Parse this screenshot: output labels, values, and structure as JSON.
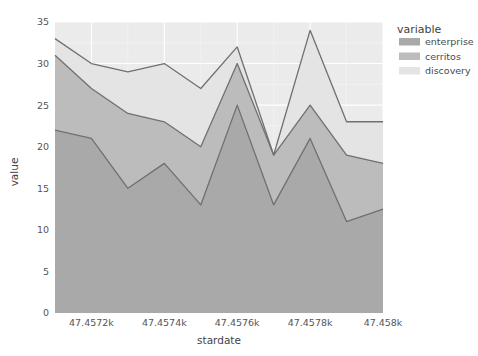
{
  "chart_data": {
    "type": "area",
    "title": "",
    "subtitle": "",
    "xlabel": "stardate",
    "ylabel": "value",
    "legend_title": "variable",
    "legend_position": "right",
    "grid": true,
    "stacked": true,
    "xlim": [
      47457.1,
      47458.0
    ],
    "ylim": [
      0,
      35
    ],
    "x": [
      47457.1,
      47457.2,
      47457.3,
      47457.4,
      47457.5,
      47457.6,
      47457.7,
      47457.8,
      47457.9,
      47458.0
    ],
    "xtick_values": [
      47457.2,
      47457.4,
      47457.6,
      47457.8,
      47458.0
    ],
    "xtick_labels": [
      "47.4572k",
      "47.4574k",
      "47.4576k",
      "47.4578k",
      "47.458k"
    ],
    "ytick_values": [
      0,
      5,
      10,
      15,
      20,
      25,
      30,
      35
    ],
    "ytick_labels": [
      "0",
      "5",
      "10",
      "15",
      "20",
      "25",
      "30",
      "35"
    ],
    "series": [
      {
        "name": "enterprise",
        "color": "#a9a9a9",
        "values": [
          22,
          21,
          15,
          18,
          13,
          25,
          13,
          21,
          11,
          12.5
        ]
      },
      {
        "name": "cerritos",
        "color": "#bcbcbc",
        "values": [
          9,
          6,
          9,
          5,
          7,
          5,
          6,
          4,
          8,
          5.5
        ]
      },
      {
        "name": "discovery",
        "color": "#e4e4e4",
        "values": [
          2,
          3,
          5,
          7,
          7,
          2,
          0,
          9,
          4,
          5
        ]
      }
    ],
    "cumulative": {
      "enterprise_top": [
        22,
        21,
        15,
        18,
        13,
        25,
        13,
        21,
        11,
        12.5
      ],
      "cerritos_top": [
        31,
        27,
        24,
        23,
        20,
        30,
        19,
        25,
        19,
        18
      ],
      "discovery_top": [
        33,
        30,
        29,
        30,
        27,
        32,
        19,
        34,
        23,
        23
      ]
    },
    "panel_background": "#ebebeb",
    "line_color": "#707070"
  },
  "legend": {
    "title": "variable",
    "items": [
      {
        "label": "enterprise",
        "color": "#a9a9a9"
      },
      {
        "label": "cerritos",
        "color": "#bcbcbc"
      },
      {
        "label": "discovery",
        "color": "#e4e4e4"
      }
    ]
  },
  "axes": {
    "x_title": "stardate",
    "y_title": "value",
    "x_ticks": [
      "47.4572k",
      "47.4574k",
      "47.4576k",
      "47.4578k",
      "47.458k"
    ],
    "y_ticks": [
      "0",
      "5",
      "10",
      "15",
      "20",
      "25",
      "30",
      "35"
    ]
  }
}
